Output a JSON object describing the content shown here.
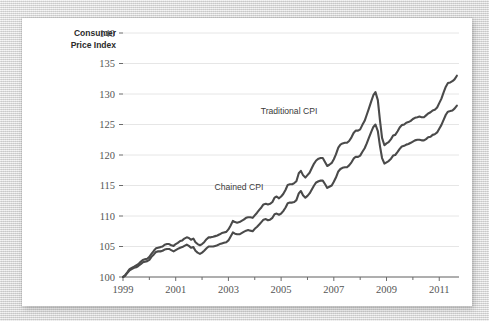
{
  "chart_data": {
    "type": "line",
    "title": "",
    "xlabel": "",
    "ylabel": "Consumer Price Index",
    "ylabel_line1": "Consumer",
    "ylabel_line2": "Price Index",
    "xlim": [
      1999,
      2011.75
    ],
    "ylim": [
      100,
      140
    ],
    "ytick_labels": [
      "100",
      "105",
      "110",
      "115",
      "120",
      "125",
      "130",
      "135",
      "140"
    ],
    "ytick_values": [
      100,
      105,
      110,
      115,
      120,
      125,
      130,
      135,
      140
    ],
    "xtick_labels": [
      "1999",
      "2001",
      "2003",
      "2005",
      "2007",
      "2009",
      "2011"
    ],
    "xtick_values": [
      1999,
      2001,
      2003,
      2005,
      2007,
      2009,
      2011
    ],
    "grid": "horizontal",
    "legend_position": "inline-annotation",
    "colors": {
      "traditional_cpi": "#4a4a4a",
      "chained_cpi": "#4a4a4a",
      "gridline": "#e6e6e6",
      "axis": "#6b6b6b",
      "panel": "#ffffff",
      "backdrop": "#d8d8d8"
    },
    "annotations": [
      {
        "text": "Traditional CPI",
        "x": 2005.3,
        "y": 126.8
      },
      {
        "text": "Chained CPI",
        "x": 2003.4,
        "y": 114.2
      }
    ],
    "series": [
      {
        "name": "Traditional CPI",
        "label": "Traditional CPI",
        "color": "#4a4a4a",
        "x": [
          1999.0,
          1999.08,
          1999.17,
          1999.25,
          1999.33,
          1999.42,
          1999.5,
          1999.58,
          1999.67,
          1999.75,
          1999.83,
          1999.92,
          2000.0,
          2000.08,
          2000.17,
          2000.25,
          2000.33,
          2000.42,
          2000.5,
          2000.58,
          2000.67,
          2000.75,
          2000.83,
          2000.92,
          2001.0,
          2001.08,
          2001.17,
          2001.25,
          2001.33,
          2001.42,
          2001.5,
          2001.58,
          2001.67,
          2001.75,
          2001.83,
          2001.92,
          2002.0,
          2002.08,
          2002.17,
          2002.25,
          2002.33,
          2002.42,
          2002.5,
          2002.58,
          2002.67,
          2002.75,
          2002.83,
          2002.92,
          2003.0,
          2003.08,
          2003.17,
          2003.25,
          2003.33,
          2003.42,
          2003.5,
          2003.58,
          2003.67,
          2003.75,
          2003.83,
          2003.92,
          2004.0,
          2004.08,
          2004.17,
          2004.25,
          2004.33,
          2004.42,
          2004.5,
          2004.58,
          2004.67,
          2004.75,
          2004.83,
          2004.92,
          2005.0,
          2005.08,
          2005.17,
          2005.25,
          2005.33,
          2005.42,
          2005.5,
          2005.58,
          2005.67,
          2005.75,
          2005.83,
          2005.92,
          2006.0,
          2006.08,
          2006.17,
          2006.25,
          2006.33,
          2006.42,
          2006.5,
          2006.58,
          2006.67,
          2006.75,
          2006.83,
          2006.92,
          2007.0,
          2007.08,
          2007.17,
          2007.25,
          2007.33,
          2007.42,
          2007.5,
          2007.58,
          2007.67,
          2007.75,
          2007.83,
          2007.92,
          2008.0,
          2008.08,
          2008.17,
          2008.25,
          2008.33,
          2008.42,
          2008.5,
          2008.58,
          2008.67,
          2008.75,
          2008.83,
          2008.92,
          2009.0,
          2009.08,
          2009.17,
          2009.25,
          2009.33,
          2009.42,
          2009.5,
          2009.58,
          2009.67,
          2009.75,
          2009.83,
          2009.92,
          2010.0,
          2010.08,
          2010.17,
          2010.25,
          2010.33,
          2010.42,
          2010.5,
          2010.58,
          2010.67,
          2010.75,
          2010.83,
          2010.92,
          2011.0,
          2011.08,
          2011.17,
          2011.25,
          2011.33,
          2011.42,
          2011.5,
          2011.58,
          2011.67
        ],
        "y": [
          100.0,
          100.3,
          100.8,
          101.3,
          101.5,
          101.7,
          101.9,
          102.1,
          102.5,
          102.8,
          102.9,
          103.0,
          103.3,
          103.8,
          104.3,
          104.7,
          104.8,
          104.9,
          105.0,
          105.3,
          105.4,
          105.4,
          105.2,
          105.1,
          105.4,
          105.6,
          105.9,
          106.0,
          106.3,
          106.5,
          106.4,
          106.1,
          106.3,
          105.7,
          105.4,
          105.2,
          105.4,
          105.7,
          106.2,
          106.5,
          106.5,
          106.6,
          106.7,
          106.8,
          107.0,
          107.2,
          107.3,
          107.4,
          107.8,
          108.4,
          109.2,
          109.0,
          108.9,
          109.0,
          109.2,
          109.4,
          109.7,
          109.8,
          109.8,
          109.7,
          110.1,
          110.5,
          111.0,
          111.4,
          111.9,
          112.0,
          111.9,
          112.0,
          112.3,
          113.0,
          113.2,
          112.9,
          113.2,
          113.6,
          114.3,
          115.1,
          115.2,
          115.2,
          115.4,
          115.7,
          117.0,
          117.4,
          116.7,
          116.3,
          116.7,
          117.1,
          117.9,
          118.6,
          119.1,
          119.4,
          119.5,
          119.5,
          118.8,
          118.2,
          118.4,
          118.7,
          119.3,
          120.1,
          121.2,
          121.7,
          121.9,
          122.0,
          122.0,
          122.3,
          122.9,
          123.6,
          124.0,
          124.0,
          124.2,
          124.9,
          125.6,
          126.6,
          127.6,
          128.8,
          129.8,
          130.3,
          129.0,
          125.7,
          122.8,
          121.6,
          121.9,
          122.1,
          122.6,
          123.2,
          123.3,
          123.9,
          124.5,
          124.9,
          125.0,
          125.3,
          125.4,
          125.6,
          125.9,
          126.1,
          126.2,
          126.3,
          126.2,
          126.2,
          126.5,
          126.8,
          127.0,
          127.3,
          127.4,
          127.8,
          128.5,
          129.2,
          130.3,
          131.2,
          131.8,
          131.9,
          132.1,
          132.4,
          133.0
        ]
      },
      {
        "name": "Chained CPI",
        "label": "Chained CPI",
        "color": "#4a4a4a",
        "x": [
          1999.0,
          1999.08,
          1999.17,
          1999.25,
          1999.33,
          1999.42,
          1999.5,
          1999.58,
          1999.67,
          1999.75,
          1999.83,
          1999.92,
          2000.0,
          2000.08,
          2000.17,
          2000.25,
          2000.33,
          2000.42,
          2000.5,
          2000.58,
          2000.67,
          2000.75,
          2000.83,
          2000.92,
          2001.0,
          2001.08,
          2001.17,
          2001.25,
          2001.33,
          2001.42,
          2001.5,
          2001.58,
          2001.67,
          2001.75,
          2001.83,
          2001.92,
          2002.0,
          2002.08,
          2002.17,
          2002.25,
          2002.33,
          2002.42,
          2002.5,
          2002.58,
          2002.67,
          2002.75,
          2002.83,
          2002.92,
          2003.0,
          2003.08,
          2003.17,
          2003.25,
          2003.33,
          2003.42,
          2003.5,
          2003.58,
          2003.67,
          2003.75,
          2003.83,
          2003.92,
          2004.0,
          2004.08,
          2004.17,
          2004.25,
          2004.33,
          2004.42,
          2004.5,
          2004.58,
          2004.67,
          2004.75,
          2004.83,
          2004.92,
          2005.0,
          2005.08,
          2005.17,
          2005.25,
          2005.33,
          2005.42,
          2005.5,
          2005.58,
          2005.67,
          2005.75,
          2005.83,
          2005.92,
          2006.0,
          2006.08,
          2006.17,
          2006.25,
          2006.33,
          2006.42,
          2006.5,
          2006.58,
          2006.67,
          2006.75,
          2006.83,
          2006.92,
          2007.0,
          2007.08,
          2007.17,
          2007.25,
          2007.33,
          2007.42,
          2007.5,
          2007.58,
          2007.67,
          2007.75,
          2007.83,
          2007.92,
          2008.0,
          2008.08,
          2008.17,
          2008.25,
          2008.33,
          2008.42,
          2008.5,
          2008.58,
          2008.67,
          2008.75,
          2008.83,
          2008.92,
          2009.0,
          2009.08,
          2009.17,
          2009.25,
          2009.33,
          2009.42,
          2009.5,
          2009.58,
          2009.67,
          2009.75,
          2009.83,
          2009.92,
          2010.0,
          2010.08,
          2010.17,
          2010.25,
          2010.33,
          2010.42,
          2010.5,
          2010.58,
          2010.67,
          2010.75,
          2010.83,
          2010.92,
          2011.0,
          2011.08,
          2011.17,
          2011.25,
          2011.33,
          2011.42,
          2011.5,
          2011.58,
          2011.67
        ],
        "y": [
          100.0,
          100.2,
          100.7,
          101.1,
          101.3,
          101.5,
          101.6,
          101.8,
          102.1,
          102.4,
          102.5,
          102.6,
          102.8,
          103.3,
          103.7,
          104.1,
          104.2,
          104.2,
          104.3,
          104.5,
          104.6,
          104.6,
          104.4,
          104.2,
          104.4,
          104.6,
          104.8,
          104.9,
          105.1,
          105.3,
          105.1,
          104.8,
          104.9,
          104.3,
          104.0,
          103.8,
          104.0,
          104.3,
          104.7,
          105.0,
          105.0,
          105.0,
          105.1,
          105.2,
          105.4,
          105.5,
          105.6,
          105.7,
          106.0,
          106.6,
          107.3,
          107.1,
          107.0,
          107.0,
          107.2,
          107.4,
          107.6,
          107.7,
          107.6,
          107.5,
          107.9,
          108.2,
          108.6,
          109.0,
          109.4,
          109.5,
          109.3,
          109.4,
          109.7,
          110.3,
          110.4,
          110.2,
          110.4,
          110.8,
          111.4,
          112.1,
          112.2,
          112.2,
          112.3,
          112.6,
          113.7,
          114.1,
          113.4,
          113.0,
          113.3,
          113.7,
          114.4,
          115.0,
          115.5,
          115.7,
          115.8,
          115.8,
          115.2,
          114.6,
          114.8,
          115.0,
          115.6,
          116.3,
          117.3,
          117.7,
          117.9,
          118.0,
          118.0,
          118.3,
          118.8,
          119.4,
          119.7,
          119.7,
          119.9,
          120.5,
          121.1,
          121.9,
          122.8,
          123.8,
          124.6,
          125.0,
          123.9,
          121.5,
          119.5,
          118.6,
          118.8,
          119.0,
          119.4,
          119.9,
          120.0,
          120.5,
          121.0,
          121.4,
          121.5,
          121.7,
          121.8,
          122.0,
          122.2,
          122.4,
          122.5,
          122.5,
          122.4,
          122.4,
          122.6,
          122.9,
          123.0,
          123.3,
          123.4,
          123.7,
          124.3,
          124.9,
          125.8,
          126.6,
          127.1,
          127.2,
          127.3,
          127.6,
          128.1
        ]
      }
    ]
  }
}
